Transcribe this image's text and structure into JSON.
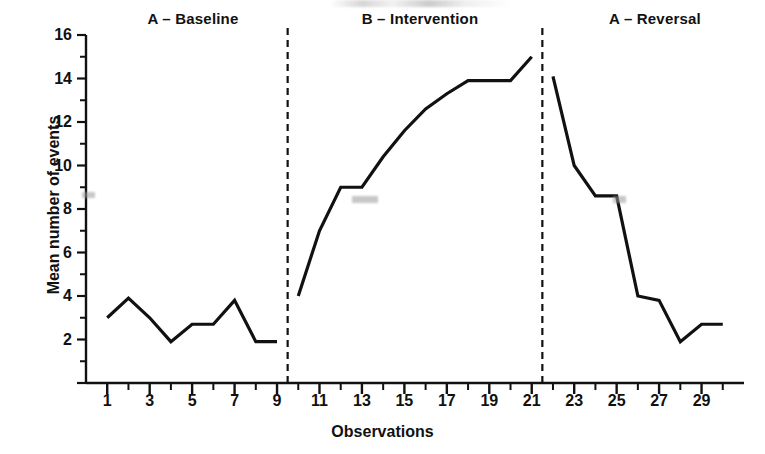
{
  "figure": {
    "width": 765,
    "height": 454,
    "background_color": "#ffffff",
    "line_color": "#111111",
    "axis_color": "#111111"
  },
  "phase_labels": [
    {
      "text": "A – Baseline",
      "center_x": 193
    },
    {
      "text": "B – Intervention",
      "center_x": 420
    },
    {
      "text": "A – Reversal",
      "center_x": 655
    }
  ],
  "chart_data": {
    "type": "line",
    "title": "",
    "xlabel": "Observations",
    "ylabel": "Mean number of events",
    "xlim": [
      0,
      31
    ],
    "ylim": [
      0,
      16
    ],
    "grid": false,
    "legend_position": "none",
    "y_major_ticks": [
      0,
      2,
      4,
      6,
      8,
      10,
      12,
      14,
      16
    ],
    "y_major_tick_labels": [
      "",
      "2",
      "4",
      "6",
      "8",
      "10",
      "12",
      "14",
      "16"
    ],
    "y_minor_ticks": [
      1,
      3,
      5,
      7,
      9,
      11,
      13,
      15
    ],
    "x_ticks": [
      1,
      2,
      3,
      4,
      5,
      6,
      7,
      8,
      9,
      10,
      11,
      12,
      13,
      14,
      15,
      16,
      17,
      18,
      19,
      20,
      21,
      22,
      23,
      24,
      25,
      26,
      27,
      28,
      29,
      30
    ],
    "x_tick_labels": [
      {
        "value": 1,
        "label": "1"
      },
      {
        "value": 3,
        "label": "3"
      },
      {
        "value": 5,
        "label": "5"
      },
      {
        "value": 7,
        "label": "7"
      },
      {
        "value": 9,
        "label": "9"
      },
      {
        "value": 11,
        "label": "11"
      },
      {
        "value": 13,
        "label": "13"
      },
      {
        "value": 15,
        "label": "15"
      },
      {
        "value": 17,
        "label": "17"
      },
      {
        "value": 19,
        "label": "19"
      },
      {
        "value": 21,
        "label": "21"
      },
      {
        "value": 23,
        "label": "23"
      },
      {
        "value": 25,
        "label": "25"
      },
      {
        "value": 27,
        "label": "27"
      },
      {
        "value": 29,
        "label": "29"
      }
    ],
    "phase_dividers": [
      9.5,
      21.5
    ],
    "series": [
      {
        "name": "A – Baseline",
        "x": [
          1,
          2,
          3,
          4,
          5,
          6,
          7,
          8,
          9
        ],
        "values": [
          3.0,
          3.9,
          3.0,
          1.9,
          2.7,
          2.7,
          3.8,
          1.9,
          1.9
        ]
      },
      {
        "name": "B – Intervention",
        "x": [
          10,
          11,
          12,
          13,
          14,
          15,
          16,
          17,
          18,
          19,
          20,
          21
        ],
        "values": [
          4.0,
          7.0,
          9.0,
          9.0,
          10.4,
          11.6,
          12.6,
          13.3,
          13.9,
          13.9,
          13.9,
          15.0
        ]
      },
      {
        "name": "A – Reversal",
        "x": [
          22,
          23,
          24,
          25,
          26,
          27,
          28,
          29,
          30
        ],
        "values": [
          14.1,
          10.0,
          8.6,
          8.6,
          4.0,
          3.8,
          1.9,
          2.7,
          2.7
        ]
      }
    ]
  }
}
